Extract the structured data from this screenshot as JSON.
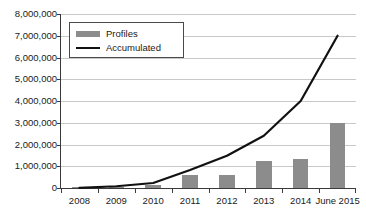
{
  "chart_data": {
    "type": "bar",
    "title": "",
    "xlabel": "",
    "ylabel": "",
    "grid": true,
    "legend_position": "top-left",
    "categories": [
      "2008",
      "2009",
      "2010",
      "2011",
      "2012",
      "2013",
      "2014",
      "June 2015"
    ],
    "ylim": [
      0,
      8000000
    ],
    "ytick_values": [
      0,
      1000000,
      2000000,
      3000000,
      4000000,
      5000000,
      6000000,
      7000000,
      8000000
    ],
    "ytick_labels": [
      "0",
      "1,000,000",
      "2,000,000",
      "3,000,000",
      "4,000,000",
      "5,000,000",
      "6,000,000",
      "7,000,000",
      "8,000,000"
    ],
    "series": [
      {
        "name": "Profiles",
        "kind": "bar",
        "color": "#8c8c8c",
        "values": [
          10000,
          60000,
          140000,
          600000,
          600000,
          1220000,
          1320000,
          3000000
        ]
      },
      {
        "name": "Accumulated",
        "kind": "line",
        "color": "#111111",
        "values": [
          10000,
          80000,
          230000,
          830000,
          1480000,
          2400000,
          4000000,
          7000000
        ]
      }
    ]
  },
  "legend": {
    "items": [
      {
        "label": "Profiles",
        "marker": "bar-swatch-icon"
      },
      {
        "label": "Accumulated",
        "marker": "line-swatch-icon"
      }
    ]
  }
}
